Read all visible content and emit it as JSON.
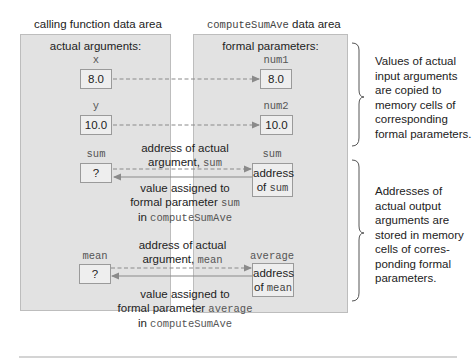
{
  "left_area": {
    "title": "calling function data area",
    "heading": "actual arguments:",
    "cells": [
      {
        "name": "x",
        "value": "8.0"
      },
      {
        "name": "y",
        "value": "10.0"
      },
      {
        "name": "sum",
        "value": "?"
      },
      {
        "name": "mean",
        "value": "?"
      }
    ]
  },
  "right_area": {
    "title_mono": "computeSumAve",
    "title_rest": " data area",
    "heading": "formal parameters:",
    "cells": [
      {
        "name": "num1",
        "value": "8.0"
      },
      {
        "name": "num2",
        "value": "10.0"
      },
      {
        "name": "sum",
        "value_line1": "address",
        "value_line2_pre": "of ",
        "value_line2_mono": "sum"
      },
      {
        "name": "average",
        "value_line1": "address",
        "value_line2_pre": "of ",
        "value_line2_mono": "mean"
      }
    ]
  },
  "arrows": {
    "sum_address": {
      "line1": "address of actual",
      "line2_pre": "argument, ",
      "line2_mono": "sum"
    },
    "sum_value": {
      "line1": "value assigned to",
      "line2_pre": "formal parameter ",
      "line2_mono": "sum",
      "line3_pre": "in ",
      "line3_mono": "computeSumAve"
    },
    "mean_address": {
      "line1": "address of actual",
      "line2_pre": "argument, ",
      "line2_mono": "mean"
    },
    "mean_value": {
      "line1": "value assigned to",
      "line2_pre": "formal parameter ",
      "line2_mono": "average",
      "line3_pre": "in ",
      "line3_mono": "computeSumAve"
    }
  },
  "notes": {
    "input": [
      "Values of actual",
      "input arguments",
      "are copied to",
      "memory cells of",
      "corresponding",
      "formal parameters."
    ],
    "output": [
      "Addresses of",
      "actual output",
      "arguments are",
      "stored in memory",
      "cells of corres-",
      "ponding formal",
      "parameters."
    ]
  },
  "colors": {
    "panel_bg": "#e2e2e2",
    "cell_bg": "#eeeeee",
    "arrow": "#8a8a8a"
  }
}
